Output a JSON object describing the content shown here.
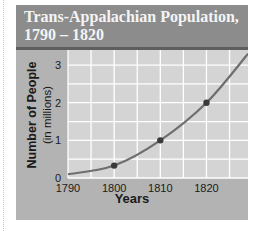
{
  "title_line1": "Trans-Appalachian Population,",
  "title_line2": "1790 – 1820",
  "ylabel_main": "Number of People",
  "ylabel_sub": "(in millions)",
  "xlabel": "Years",
  "colors": {
    "panel": "#b3b3b3",
    "title_bar": "#8c8c8c",
    "title_border": "#5e5e5e",
    "plot_bg": "#d4d4d4",
    "grid": "#ffffff",
    "line": "#6e6e6e",
    "marker": "#3a3a3a"
  },
  "chart_data": {
    "type": "line",
    "title": "Trans-Appalachian Population, 1790 – 1820",
    "xlabel": "Years",
    "ylabel": "Number of People (in millions)",
    "x_ticks": [
      1790,
      1800,
      1810,
      1820
    ],
    "y_ticks": [
      0,
      1,
      2,
      3
    ],
    "xlim": [
      1790,
      1829
    ],
    "ylim": [
      0,
      3.4
    ],
    "grid": true,
    "legend": "none",
    "series": [
      {
        "name": "Trans-Appalachian Population",
        "x": [
          1790,
          1800,
          1810,
          1820
        ],
        "values": [
          0.1,
          0.33,
          1.0,
          2.0
        ],
        "markers_at": [
          1800,
          1810,
          1820
        ],
        "trend_extends_to": {
          "x": 1829,
          "y": 3.3
        }
      }
    ]
  }
}
